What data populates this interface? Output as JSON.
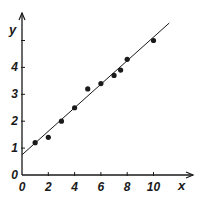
{
  "chart_data": {
    "type": "scatter",
    "title": "",
    "xlabel": "x",
    "ylabel": "y",
    "xlim": [
      0,
      11.5
    ],
    "ylim": [
      0,
      5.8
    ],
    "xticks": [
      0,
      2,
      4,
      6,
      8,
      10
    ],
    "xtick_labels": [
      "0",
      "2",
      "4",
      "6",
      "8",
      "10"
    ],
    "yticks": [
      0,
      1,
      2,
      3,
      4,
      5
    ],
    "ytick_labels": [
      "0",
      "1",
      "2",
      "3",
      "4",
      ""
    ],
    "grid": false,
    "legend": null,
    "series": [
      {
        "name": "data points",
        "type": "scatter",
        "x": [
          1,
          2,
          3,
          4,
          5,
          6,
          7,
          7.5,
          8,
          10
        ],
        "y": [
          1.2,
          1.4,
          2.0,
          2.5,
          3.2,
          3.4,
          3.7,
          3.9,
          4.3,
          5.0
        ]
      },
      {
        "name": "best-fit line",
        "type": "line",
        "x": [
          0,
          11.2
        ],
        "y": [
          0.75,
          5.65
        ]
      }
    ]
  },
  "axes": {
    "x_label": "x",
    "y_label": "y",
    "origin_label": "0"
  },
  "colors": {
    "ink": "#1a1a1a",
    "background": "#ffffff"
  }
}
